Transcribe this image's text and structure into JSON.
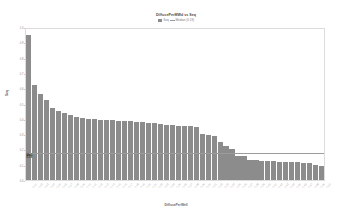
{
  "chart_data": {
    "type": "bar",
    "title": "DiffusePerMWd vs Seq",
    "subtitle": "",
    "xlabel": "DiffusePerWell",
    "ylabel": "Seq",
    "grid": false,
    "legend_position": "top-center",
    "legend": [
      {
        "label": "Seq",
        "color": "#8c8c8c",
        "marker": "bar"
      },
      {
        "label": "Median (0.19)",
        "color": "#9c9c9c",
        "marker": "line"
      }
    ],
    "reference_line": {
      "label_line1": "Med",
      "label_line2": "0.19",
      "value": 0.19,
      "color": "#9c9c9c"
    },
    "ylim": [
      0,
      1.0
    ],
    "yticks": [
      0.0,
      0.1,
      0.2,
      0.3,
      0.4,
      0.5,
      0.6,
      0.7,
      0.8,
      0.9,
      1.0
    ],
    "ytick_labels": [
      "0.0",
      "0.1",
      "0.2",
      "0.3",
      "0.4",
      "0.5",
      "0.6",
      "0.7",
      "0.8",
      "0.9",
      "1.0"
    ],
    "categories": [
      "C-01",
      "C-02",
      "C-03",
      "C-04",
      "C-05",
      "C-06",
      "C-07",
      "C-08",
      "C-09",
      "C-10",
      "C-11",
      "C-12",
      "C-13",
      "C-14",
      "C-15",
      "C-16",
      "C-17",
      "C-18",
      "C-19",
      "C-20",
      "C-21",
      "C-22",
      "C-23",
      "C-24",
      "C-25",
      "C-26",
      "C-27",
      "C-28",
      "C-29",
      "C-30",
      "C-31",
      "C-32",
      "C-33",
      "C-34",
      "C-35",
      "C-36",
      "C-37",
      "C-38",
      "C-39",
      "C-40",
      "C-41",
      "C-42",
      "C-43",
      "C-44",
      "C-45",
      "C-46",
      "C-47",
      "C-48",
      "C-49",
      "C-50"
    ],
    "values": [
      0.945,
      0.62,
      0.56,
      0.52,
      0.47,
      0.45,
      0.44,
      0.425,
      0.415,
      0.405,
      0.4,
      0.398,
      0.395,
      0.392,
      0.39,
      0.388,
      0.386,
      0.384,
      0.382,
      0.38,
      0.375,
      0.37,
      0.366,
      0.362,
      0.358,
      0.355,
      0.352,
      0.35,
      0.348,
      0.3,
      0.292,
      0.285,
      0.25,
      0.225,
      0.205,
      0.16,
      0.155,
      0.13,
      0.128,
      0.126,
      0.124,
      0.122,
      0.12,
      0.119,
      0.118,
      0.117,
      0.112,
      0.108,
      0.1,
      0.092
    ]
  }
}
